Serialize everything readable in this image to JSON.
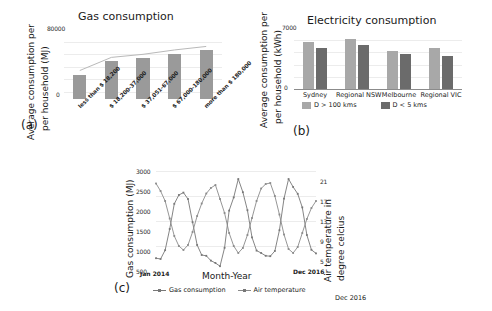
{
  "figure": {
    "background": "#ffffff",
    "panels": [
      "a",
      "b",
      "c"
    ]
  },
  "panel_a": {
    "letter": "(a)",
    "title": "Gas consumption",
    "ylabel_line1": "Average consumption per",
    "ylabel_line2": "per household (MJ)",
    "ytick_top": "80000",
    "ytick_bottom": "0",
    "bar_color": "#9a9a9a",
    "trend_color": "#b9b9b9"
  },
  "panel_b": {
    "letter": "(b)",
    "title": "Electricity consumption",
    "ylabel_line1": "Average consumption per",
    "ylabel_line2": "per household (kWh)",
    "ytick_top": "7000",
    "ytick_bottom": "0",
    "legend": [
      {
        "label": "D > 100 kms",
        "color": "#a8a8a8"
      },
      {
        "label": "D < 5 kms",
        "color": "#6b6b6b"
      }
    ]
  },
  "panel_c": {
    "letter": "(c)",
    "xlabel": "Month-Year",
    "ylabel_left": "Gas consumption (MJ)",
    "ylabel_right_line1": "Air temperature in",
    "ylabel_right_line2": "degree celcius",
    "start_date": "Jan 2014",
    "end_date": "Dec 2016",
    "corner_note": "Dec 2016",
    "legend": [
      {
        "label": "Gas consumption",
        "color": "#777777"
      },
      {
        "label": "Air temperature",
        "color": "#8a8a8a"
      }
    ]
  },
  "chart_data": [
    {
      "type": "bar",
      "panel": "a",
      "title": "Gas consumption",
      "xlabel": "",
      "ylabel": "Average consumption per per household (MJ)",
      "ylim": [
        0,
        80000
      ],
      "yticks": [
        0,
        80000
      ],
      "grid": true,
      "legend": null,
      "categories": [
        "less than $ 18,200",
        "$ 18,200-37,000",
        "$ 37,051-67,000",
        "$ 67,000-180,000",
        "more than $ 180,000"
      ],
      "values": [
        28000,
        43000,
        46500,
        51500,
        55500
      ],
      "overlay_line": {
        "name": "trend",
        "values": [
          28000,
          43000,
          46500,
          51500,
          55500
        ]
      }
    },
    {
      "type": "bar",
      "panel": "b",
      "title": "Electricity consumption",
      "xlabel": "",
      "ylabel": "Average consumption per per household (kWh)",
      "ylim": [
        0,
        7000
      ],
      "yticks": [
        0,
        7000
      ],
      "grid": true,
      "legend_position": "below-axis",
      "categories": [
        "Sydney",
        "Regional NSW",
        "Melbourne",
        "Regional VIC"
      ],
      "series": [
        {
          "name": "D > 100 kms",
          "color": "#a8a8a8",
          "values": [
            5350,
            5700,
            4350,
            4700
          ]
        },
        {
          "name": "D < 5 kms",
          "color": "#6b6b6b",
          "values": [
            4700,
            5000,
            4050,
            3800
          ]
        }
      ]
    },
    {
      "type": "line",
      "panel": "c",
      "title": "",
      "xlabel": "Month-Year",
      "ylabel": "Gas consumption (MJ)",
      "ylabel_secondary": "Air temperature in degree celcius",
      "ylim": [
        500,
        3000
      ],
      "yticks": [
        500,
        1000,
        1500,
        2000,
        2500,
        3000
      ],
      "ylim_secondary": [
        3,
        23
      ],
      "yticks_secondary": [
        5,
        9,
        13,
        17,
        21
      ],
      "grid": true,
      "x": [
        "Jan 2014",
        "Feb 2014",
        "Mar 2014",
        "Apr 2014",
        "May 2014",
        "Jun 2014",
        "Jul 2014",
        "Aug 2014",
        "Sep 2014",
        "Oct 2014",
        "Nov 2014",
        "Dec 2014",
        "Jan 2015",
        "Feb 2015",
        "Mar 2015",
        "Apr 2015",
        "May 2015",
        "Jun 2015",
        "Jul 2015",
        "Aug 2015",
        "Sep 2015",
        "Oct 2015",
        "Nov 2015",
        "Dec 2015",
        "Jan 2016",
        "Feb 2016",
        "Mar 2016",
        "Apr 2016",
        "May 2016",
        "Jun 2016",
        "Jul 2016",
        "Aug 2016",
        "Sep 2016",
        "Oct 2016",
        "Nov 2016",
        "Dec 2016"
      ],
      "xtick_labels": [
        "Jan 2014",
        "Dec 2016"
      ],
      "series": [
        {
          "name": "Gas consumption",
          "color": "#777777",
          "axis": "left",
          "values": [
            820,
            800,
            1020,
            1550,
            2180,
            2400,
            2460,
            2300,
            1720,
            1150,
            900,
            880,
            760,
            700,
            620,
            1080,
            2010,
            2340,
            2800,
            2470,
            2020,
            1340,
            1010,
            950,
            880,
            870,
            1000,
            1520,
            2310,
            2800,
            2600,
            2430,
            2090,
            1400,
            1030,
            940
          ]
        },
        {
          "name": "Air temperature",
          "color": "#8a8a8a",
          "axis": "right",
          "values": [
            20.5,
            19.0,
            17.0,
            13.5,
            10.0,
            8.0,
            7.2,
            8.2,
            10.8,
            14.0,
            16.5,
            18.5,
            19.6,
            20.2,
            17.4,
            14.6,
            10.6,
            8.0,
            6.6,
            7.6,
            10.2,
            13.6,
            17.0,
            19.5,
            20.4,
            20.6,
            18.0,
            14.3,
            10.3,
            7.4,
            6.6,
            7.8,
            10.6,
            13.4,
            15.6,
            17.0
          ]
        }
      ]
    }
  ]
}
